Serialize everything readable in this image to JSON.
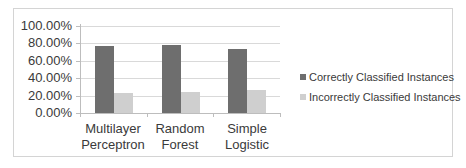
{
  "chart_data": {
    "type": "bar",
    "title": "",
    "xlabel": "",
    "ylabel": "",
    "categories": [
      "Multilayer Perceptron",
      "Random Forest",
      "Simple Logistic"
    ],
    "category_lines": [
      [
        "Multilayer",
        "Perceptron"
      ],
      [
        "Random",
        "Forest"
      ],
      [
        "Simple",
        "Logistic"
      ]
    ],
    "series": [
      {
        "name": "Correctly Classified Instances",
        "color": "#6e6e6e",
        "values": [
          77,
          78,
          74
        ]
      },
      {
        "name": "Incorrectly Classified Instances",
        "color": "#cfcfcf",
        "values": [
          23,
          24,
          26
        ]
      }
    ],
    "ylim": [
      0,
      100
    ],
    "yticks": [
      "0.00%",
      "20.00%",
      "40.00%",
      "60.00%",
      "80.00%",
      "100.00%"
    ],
    "grid": true,
    "legend_position": "right"
  }
}
